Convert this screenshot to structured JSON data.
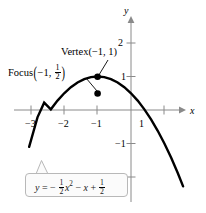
{
  "figure": {
    "stroke_color": "#000000",
    "axis_color": "#8a8a8a",
    "callout_border_color": "#b8b8b8",
    "callout_fill_color": "#fbfbfb"
  },
  "axes": {
    "x_label": "x",
    "y_label": "y",
    "x_ticks": [
      {
        "value": -3,
        "label": "−3"
      },
      {
        "value": -2,
        "label": "−2"
      },
      {
        "value": -1,
        "label": "−1"
      },
      {
        "value": 1,
        "label": "1"
      }
    ],
    "y_ticks": [
      {
        "value": 2,
        "label": "2"
      },
      {
        "value": 1,
        "label": "1"
      },
      {
        "value": -1,
        "label": "−1"
      },
      {
        "value": -2,
        "label": "−2"
      }
    ]
  },
  "annotations": {
    "vertex": {
      "name": "Vertex",
      "point_text": "(−1, 1)",
      "x": -1,
      "y": 1
    },
    "focus": {
      "name": "Focus",
      "point_text": "(−1, 1/2)",
      "x": -1,
      "y": 0.5,
      "fraction_numerator": "1",
      "fraction_denominator": "2"
    }
  },
  "equation": {
    "lhs": "y",
    "equals": "=",
    "text": "y = − 1/2 x² − x + 1/2",
    "term1_sign": "−",
    "term1_num": "1",
    "term1_den": "2",
    "term1_var": "x",
    "term1_exp": "2",
    "term2_sign": "−",
    "term2_var": "x",
    "term3_sign": "+",
    "term3_num": "1",
    "term3_den": "2"
  },
  "chart_data": {
    "type": "line",
    "title": "",
    "xlabel": "x",
    "ylabel": "y",
    "xlim": [
      -3.5,
      1.6
    ],
    "ylim": [
      -2.4,
      2.3
    ],
    "grid": false,
    "legend": "none",
    "function": "y = -0.5*x^2 - x + 0.5",
    "series": [
      {
        "name": "parabola",
        "x": [
          -3.05,
          -2.8,
          -2.6,
          -2.4,
          -2.2,
          -2.0,
          -1.8,
          -1.6,
          -1.4,
          -1.2,
          -1.0,
          -0.8,
          -0.6,
          -0.4,
          -0.2,
          0.0,
          0.2,
          0.4,
          0.6,
          0.8,
          1.0,
          1.2,
          1.4,
          1.56
        ],
        "y": [
          -1.1,
          -0.22,
          0.22,
          0.02,
          0.28,
          0.5,
          0.68,
          0.82,
          0.92,
          0.98,
          1.0,
          0.98,
          0.92,
          0.82,
          0.68,
          0.5,
          0.28,
          0.02,
          -0.28,
          -0.62,
          -1.0,
          -1.42,
          -1.88,
          -2.28
        ]
      }
    ],
    "points": [
      {
        "name": "vertex",
        "x": -1,
        "y": 1,
        "marker": "filled-circle"
      },
      {
        "name": "focus",
        "x": -1,
        "y": 0.5,
        "marker": "filled-circle"
      }
    ]
  }
}
